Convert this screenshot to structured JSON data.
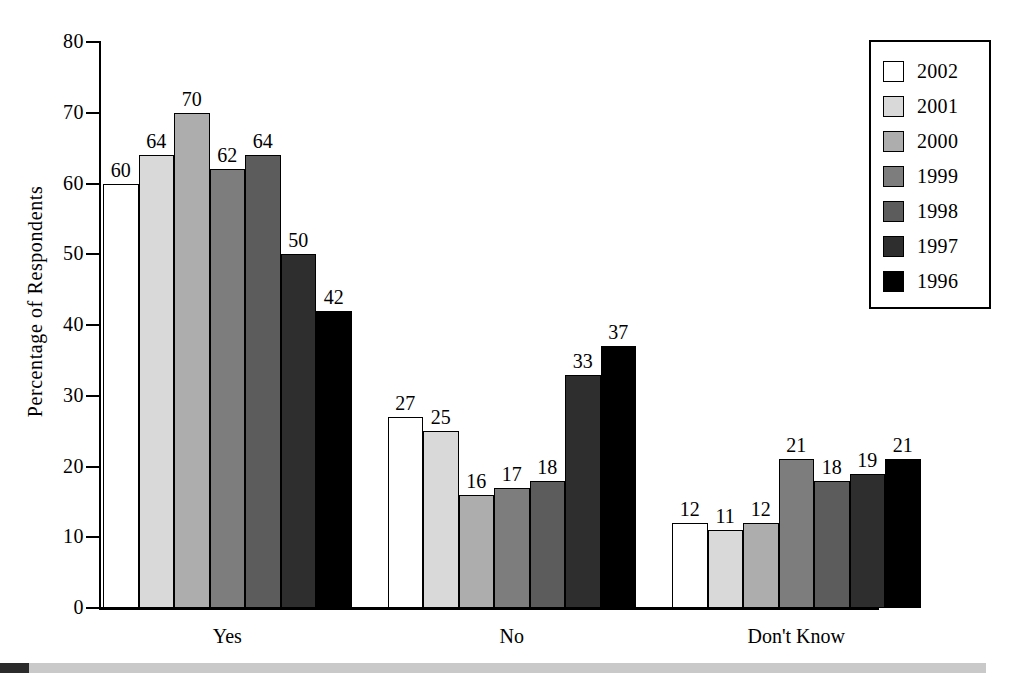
{
  "chart_data": {
    "type": "bar",
    "title": "",
    "xlabel": "",
    "ylabel": "Percentage of Respondents",
    "ylim": [
      0,
      80
    ],
    "yticks": [
      0,
      10,
      20,
      30,
      40,
      50,
      60,
      70,
      80
    ],
    "grid": false,
    "legend_position": "top-right",
    "categories": [
      "Yes",
      "No",
      "Don't Know"
    ],
    "series": [
      {
        "name": "2002",
        "color": "#ffffff",
        "values": [
          60,
          27,
          12
        ]
      },
      {
        "name": "2001",
        "color": "#d9d9d9",
        "values": [
          64,
          25,
          11
        ]
      },
      {
        "name": "2000",
        "color": "#adadad",
        "values": [
          70,
          16,
          12
        ]
      },
      {
        "name": "1999",
        "color": "#7d7d7d",
        "values": [
          62,
          17,
          21
        ]
      },
      {
        "name": "1998",
        "color": "#5c5c5c",
        "values": [
          64,
          18,
          18
        ]
      },
      {
        "name": "1997",
        "color": "#2e2e2e",
        "values": [
          50,
          33,
          19
        ]
      },
      {
        "name": "1996",
        "color": "#000000",
        "values": [
          42,
          37,
          21
        ]
      }
    ],
    "data_labels": {
      "Yes": [
        60,
        64,
        70,
        62,
        64,
        50,
        42
      ],
      "No": [
        27,
        25,
        16,
        17,
        18,
        33,
        37
      ],
      "Don't Know": [
        12,
        11,
        12,
        21,
        18,
        19,
        21
      ]
    }
  },
  "legend": {
    "entries": [
      {
        "label": "2002"
      },
      {
        "label": "2001"
      },
      {
        "label": "2000"
      },
      {
        "label": "1999"
      },
      {
        "label": "1998"
      },
      {
        "label": "1997"
      },
      {
        "label": "1996"
      }
    ]
  },
  "axis": {
    "y_title": "Percentage of Respondents",
    "y_tick_labels": [
      "80",
      "70",
      "60",
      "50",
      "40",
      "30",
      "20",
      "10",
      "0"
    ]
  },
  "footer": {
    "gray_bar_color": "#c9c9c9",
    "dark_block_color": "#2b2b2b"
  }
}
